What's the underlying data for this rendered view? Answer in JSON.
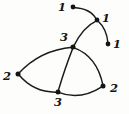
{
  "figure": {
    "kind": "hand-drawn-graph-diagram",
    "width": 129,
    "height": 114,
    "background_color": "#fdfdfc",
    "ink_color": "#141414"
  },
  "nodes": [
    {
      "id": "n1",
      "label": "1",
      "x": 73,
      "y": 7,
      "label_x": 62,
      "label_y": 8,
      "dot_r": 2.4
    },
    {
      "id": "n2",
      "label": "1",
      "x": 97,
      "y": 20,
      "label_x": 106,
      "label_y": 19,
      "dot_r": 2.4
    },
    {
      "id": "n3",
      "label": "1",
      "x": 108,
      "y": 44,
      "label_x": 117,
      "label_y": 45,
      "dot_r": 2.4
    },
    {
      "id": "n4",
      "label": "3",
      "x": 73,
      "y": 47,
      "label_x": 64,
      "label_y": 38,
      "dot_r": 2.5
    },
    {
      "id": "n5",
      "label": "2",
      "x": 18,
      "y": 74,
      "label_x": 7,
      "label_y": 77,
      "dot_r": 2.5
    },
    {
      "id": "n6",
      "label": "3",
      "x": 58,
      "y": 92,
      "label_x": 58,
      "label_y": 103,
      "dot_r": 2.5
    },
    {
      "id": "n7",
      "label": "2",
      "x": 103,
      "y": 86,
      "label_x": 114,
      "label_y": 89,
      "dot_r": 2.5
    }
  ],
  "edges": [
    {
      "id": "e1",
      "from": "n1",
      "to": "n2",
      "path": "M 73.5 7.5 Q 91 8.5 96.5 19.5"
    },
    {
      "id": "e2",
      "from": "n2",
      "to": "n3",
      "path": "M 97.5 20.5 Q 107 29 108 43.5"
    },
    {
      "id": "e3",
      "from": "n2",
      "to": "n4",
      "path": "M 96.8 20.6 Q 83 27 73.4 46.6"
    },
    {
      "id": "e4",
      "from": "n5",
      "to": "n4",
      "path": "M 18.5 73.5 Q 40 50 72.6 47.2"
    },
    {
      "id": "e5",
      "from": "n5",
      "to": "n6",
      "path": "M 18.6 74.6 Q 34 93 57.4 92.2"
    },
    {
      "id": "e6",
      "from": "n4",
      "to": "n6",
      "path": "M 73 47.8 Q 65 68 58 91.6"
    },
    {
      "id": "e7",
      "from": "n4",
      "to": "n7",
      "path": "M 73.6 47.6 Q 97 56 103 85.4"
    },
    {
      "id": "e8",
      "from": "n6",
      "to": "n7",
      "path": "M 58.6 92.4 Q 80 101 102.6 86.4"
    }
  ]
}
